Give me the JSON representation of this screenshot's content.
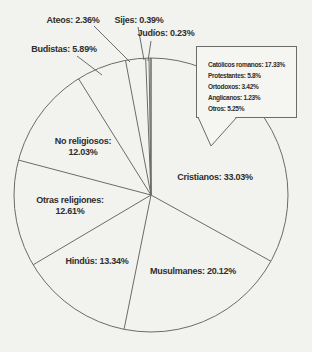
{
  "chart_data": {
    "type": "pie",
    "title": "",
    "units": "%",
    "start_angle_deg": 0,
    "direction": "clockwise",
    "slices": [
      {
        "label": "Cristianos",
        "value": 33.03,
        "display": "Cristianos: 33.03%"
      },
      {
        "label": "Musulmanes",
        "value": 20.12,
        "display": "Musulmanes: 20.12%"
      },
      {
        "label": "Hindús",
        "value": 13.34,
        "display": "Hindús: 13.34%"
      },
      {
        "label": "Otras religiones",
        "value": 12.61,
        "display": "Otras religiones: 12.61%",
        "display_line1": "Otras religiones:",
        "display_line2": "12.61%"
      },
      {
        "label": "No religiosos",
        "value": 12.03,
        "display": "No religiosos: 12.03%",
        "display_line1": "No religiosos:",
        "display_line2": "12.03%"
      },
      {
        "label": "Budistas",
        "value": 5.89,
        "display": "Budistas: 5.89%"
      },
      {
        "label": "Ateos",
        "value": 2.36,
        "display": "Ateos: 2.36%"
      },
      {
        "label": "Sijes",
        "value": 0.39,
        "display": "Sijes: 0.39%"
      },
      {
        "label": "Judíos",
        "value": 0.23,
        "display": "Judíos: 0.23%"
      }
    ],
    "callout": {
      "target": "Cristianos",
      "entries": [
        {
          "label": "Católicos romanos",
          "value": 17.33,
          "display": "Católicos romanos: 17.33%"
        },
        {
          "label": "Protestantes",
          "value": 5.8,
          "display": "Protestantes: 5.8%"
        },
        {
          "label": "Ortodoxos",
          "value": 3.42,
          "display": "Ortodoxos: 3.42%"
        },
        {
          "label": "Anglicanos",
          "value": 1.23,
          "display": "Anglicanos: 1.23%"
        },
        {
          "label": "Otros",
          "value": 5.25,
          "display": "Otros: 5.25%"
        }
      ]
    },
    "palette": {
      "background": "#f2f2ee",
      "stroke": "#6b6b6b",
      "text": "#2e2e2e"
    },
    "legend_position": "top-right-callout",
    "grid": false
  }
}
